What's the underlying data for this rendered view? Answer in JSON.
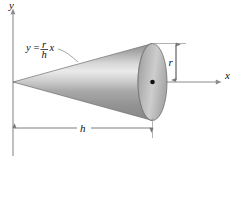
{
  "figure": {
    "type": "geometry-diagram",
    "background_color": "#ffffff"
  },
  "axes": {
    "y_axis": {
      "label": "y",
      "orientation": "vertical",
      "color": "#808080"
    },
    "x_axis": {
      "label": "x",
      "orientation": "horizontal",
      "color": "#808080"
    },
    "origin_label": ""
  },
  "equation": {
    "lhs": "y",
    "equals": "=",
    "numerator": "r",
    "denominator": "h",
    "variable": "x",
    "full_text": "y = (r/h)x"
  },
  "dimensions": {
    "radius": {
      "label": "r",
      "orientation": "vertical",
      "arrow_style": "double-headed"
    },
    "height": {
      "label": "h",
      "orientation": "horizontal",
      "arrow_style": "double-headed"
    }
  },
  "solid": {
    "name": "cone",
    "apex_at": "origin",
    "base": "ellipse",
    "shading": {
      "light": "#e8e8e8",
      "mid": "#b4b4b4",
      "dark": "#8a8a8a",
      "outline": "#4a4a4a"
    },
    "center_point_label": ""
  },
  "colors": {
    "line": "#8c8c8c",
    "text": "#111111",
    "dimension_line": "#9a9a9a"
  }
}
